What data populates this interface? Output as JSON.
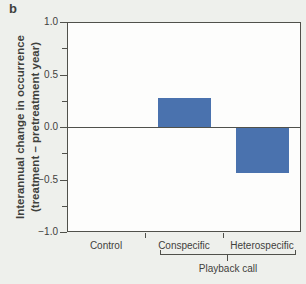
{
  "panel_label": "b",
  "colors": {
    "background": "#eef0ec",
    "plot_background": "#fdfdfc",
    "axis": "#50514b",
    "bar": "#4a72ae",
    "text": "#3f413c"
  },
  "chart_data": {
    "type": "bar",
    "title": "",
    "categories": [
      "Control",
      "Conspecific",
      "Heterospecific"
    ],
    "values": [
      0,
      0.28,
      -0.43
    ],
    "ylabel_line1": "Interannual change in occurrence",
    "ylabel_line2": "(treatment – pretreatment year)",
    "xlabel": "",
    "ylim": [
      -1.0,
      1.0
    ],
    "ytick_major_values": [
      1.0,
      0.5,
      0.0,
      -0.5,
      -1.0
    ],
    "ytick_major_labels": [
      "1.0",
      "0.5",
      "0.0",
      "−0.5",
      "−1.0"
    ],
    "ytick_minor_values": [
      0.75,
      0.25,
      -0.25,
      -0.75
    ],
    "grid": "off",
    "legend": "none",
    "zero_line": true,
    "group_bracket": {
      "label": "Playback call",
      "categories": [
        "Conspecific",
        "Heterospecific"
      ]
    }
  }
}
